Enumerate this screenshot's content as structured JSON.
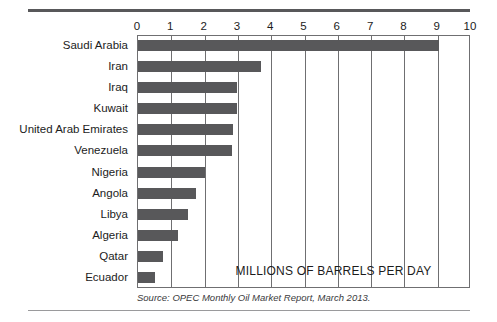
{
  "chart_data": {
    "type": "bar",
    "orientation": "horizontal",
    "title": "",
    "subtitle": "",
    "xlabel": "MILLIONS OF BARRELS PER DAY",
    "ylabel": "",
    "xlim": [
      0,
      10
    ],
    "xticks": [
      0,
      1,
      2,
      3,
      4,
      5,
      6,
      7,
      8,
      9,
      10
    ],
    "xtick_labels": [
      "0",
      "1",
      "2",
      "3",
      "4",
      "5",
      "6",
      "7",
      "8",
      "9",
      "10"
    ],
    "grid": true,
    "grid_axis": "x",
    "legend": false,
    "legend_position": "none",
    "bar_color": "#58585a",
    "categories": [
      "Saudi Arabia",
      "Iran",
      "Iraq",
      "Kuwait",
      "United Arab Emirates",
      "Venezuela",
      "Nigeria",
      "Angola",
      "Libya",
      "Algeria",
      "Qatar",
      "Ecuador"
    ],
    "values": [
      9.05,
      3.7,
      2.98,
      2.98,
      2.85,
      2.82,
      2.0,
      1.75,
      1.5,
      1.2,
      0.75,
      0.5
    ],
    "annotations": [
      {
        "text": "MILLIONS OF BARRELS PER DAY",
        "position": "inside-plot-bottom-center"
      }
    ],
    "source": "Source: OPEC Monthly Oil Market Report, March 2013."
  },
  "figure": {
    "axis_caption": "MILLIONS OF BARRELS PER DAY",
    "source_note": "Source: OPEC Monthly Oil Market Report, March 2013."
  }
}
